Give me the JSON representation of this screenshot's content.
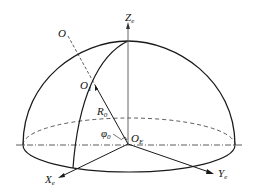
{
  "diagram": {
    "type": "hemisphere-coordinate-system",
    "labels": {
      "z_axis": "Z",
      "z_axis_sub": "e",
      "x_axis": "X",
      "x_axis_sub": "e",
      "y_axis": "Y",
      "y_axis_sub": "e",
      "origin": "O",
      "origin_sub": "E",
      "point_o": "O",
      "point_o1": "O",
      "point_o1_sub": "1",
      "radius": "R",
      "radius_sub": "0",
      "angle": "φ",
      "angle_sub": "0"
    },
    "colors": {
      "stroke": "#1a1a1a",
      "axis": "#555555",
      "background": "#ffffff"
    }
  }
}
